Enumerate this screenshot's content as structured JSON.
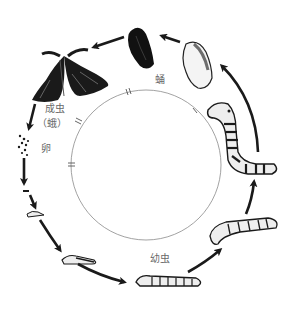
{
  "diagram": {
    "title": "",
    "stages": [
      {
        "id": "adult",
        "label": "成虫",
        "sub_label": "（蛾）"
      },
      {
        "id": "egg",
        "label": "卵"
      },
      {
        "id": "larva",
        "label": "幼虫"
      },
      {
        "id": "pupa",
        "label": "蛹"
      }
    ],
    "cycle_order": [
      "egg",
      "larva",
      "cocoon",
      "pupa",
      "adult",
      "egg"
    ],
    "colors": {
      "ink": "#1a1a1a",
      "circle": "#8a8a8a",
      "label": "#6a6a6a",
      "background": "#ffffff"
    }
  }
}
